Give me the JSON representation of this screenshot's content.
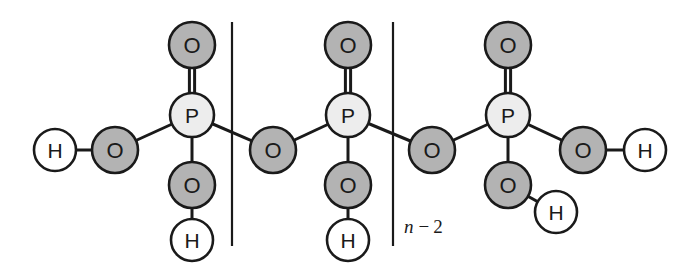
{
  "figure": {
    "background_color": "#ffffff",
    "width": 692,
    "height": 266
  },
  "colors": {
    "oxygen_fill": "#b3b3b3",
    "phosphorus_fill": "#ededed",
    "hydrogen_fill": "#ffffff",
    "outline": "#1a1a1a",
    "bond": "#1a1a1a",
    "text": "#1a1a1a",
    "bracket": "#1a1a1a"
  },
  "atom_labels": {
    "oxygen": "O",
    "phosphorus": "P",
    "hydrogen": "H"
  },
  "repeat_unit": {
    "label_variable": "n",
    "label_operator": "−",
    "label_value": "2",
    "label_full": "n − 2"
  },
  "atoms": [
    {
      "id": "h-left-terminal",
      "element": "H",
      "label": "H",
      "cx": 55,
      "cy": 150,
      "r": 21
    },
    {
      "id": "o-left-hydroxyl",
      "element": "O",
      "label": "O",
      "cx": 115,
      "cy": 150,
      "r": 23
    },
    {
      "id": "p-unit-1",
      "element": "P",
      "label": "P",
      "cx": 192,
      "cy": 115,
      "r": 22
    },
    {
      "id": "o-double-unit-1",
      "element": "O",
      "label": "O",
      "cx": 192,
      "cy": 45,
      "r": 23
    },
    {
      "id": "o-lower-unit-1",
      "element": "O",
      "label": "O",
      "cx": 192,
      "cy": 185,
      "r": 23
    },
    {
      "id": "h-lower-unit-1",
      "element": "H",
      "label": "H",
      "cx": 192,
      "cy": 240,
      "r": 21
    },
    {
      "id": "o-bridge-1",
      "element": "O",
      "label": "O",
      "cx": 273,
      "cy": 150,
      "r": 23
    },
    {
      "id": "p-unit-2",
      "element": "P",
      "label": "P",
      "cx": 348,
      "cy": 115,
      "r": 22
    },
    {
      "id": "o-double-unit-2",
      "element": "O",
      "label": "O",
      "cx": 348,
      "cy": 45,
      "r": 23
    },
    {
      "id": "o-lower-unit-2",
      "element": "O",
      "label": "O",
      "cx": 348,
      "cy": 185,
      "r": 23
    },
    {
      "id": "h-lower-unit-2",
      "element": "H",
      "label": "H",
      "cx": 348,
      "cy": 240,
      "r": 21
    },
    {
      "id": "o-bridge-2",
      "element": "O",
      "label": "O",
      "cx": 432,
      "cy": 150,
      "r": 23
    },
    {
      "id": "p-unit-3",
      "element": "P",
      "label": "P",
      "cx": 508,
      "cy": 115,
      "r": 22
    },
    {
      "id": "o-double-unit-3",
      "element": "O",
      "label": "O",
      "cx": 508,
      "cy": 45,
      "r": 23
    },
    {
      "id": "o-lower-unit-3",
      "element": "O",
      "label": "O",
      "cx": 508,
      "cy": 185,
      "r": 23
    },
    {
      "id": "h-lower-unit-3",
      "element": "H",
      "label": "H",
      "cx": 556,
      "cy": 212,
      "r": 21
    },
    {
      "id": "o-right-hydroxyl",
      "element": "O",
      "label": "O",
      "cx": 583,
      "cy": 150,
      "r": 23
    },
    {
      "id": "h-right-terminal",
      "element": "H",
      "label": "H",
      "cx": 645,
      "cy": 150,
      "r": 21
    }
  ],
  "bonds": [
    {
      "id": "bond-h-o-left",
      "from": "h-left-terminal",
      "to": "o-left-hydroxyl",
      "order": 1
    },
    {
      "id": "bond-o-p-left",
      "from": "o-left-hydroxyl",
      "to": "p-unit-1",
      "order": 1
    },
    {
      "id": "bond-p1-odouble",
      "from": "p-unit-1",
      "to": "o-double-unit-1",
      "order": 2
    },
    {
      "id": "bond-p1-olower",
      "from": "p-unit-1",
      "to": "o-lower-unit-1",
      "order": 1
    },
    {
      "id": "bond-olower1-h",
      "from": "o-lower-unit-1",
      "to": "h-lower-unit-1",
      "order": 1
    },
    {
      "id": "bond-p1-obridge1",
      "from": "p-unit-1",
      "to": "o-bridge-1",
      "order": 1
    },
    {
      "id": "bond-obridge1-p2",
      "from": "o-bridge-1",
      "to": "p-unit-2",
      "order": 1
    },
    {
      "id": "bond-p2-odouble",
      "from": "p-unit-2",
      "to": "o-double-unit-2",
      "order": 2
    },
    {
      "id": "bond-p2-olower",
      "from": "p-unit-2",
      "to": "o-lower-unit-2",
      "order": 1
    },
    {
      "id": "bond-olower2-h",
      "from": "o-lower-unit-2",
      "to": "h-lower-unit-2",
      "order": 1
    },
    {
      "id": "bond-p2-obridge2",
      "from": "p-unit-2",
      "to": "o-bridge-2",
      "order": 1
    },
    {
      "id": "bond-obridge2-p3",
      "from": "o-bridge-2",
      "to": "p-unit-3",
      "order": 1
    },
    {
      "id": "bond-p3-odouble",
      "from": "p-unit-3",
      "to": "o-double-unit-3",
      "order": 2
    },
    {
      "id": "bond-p3-olower",
      "from": "p-unit-3",
      "to": "o-lower-unit-3",
      "order": 1
    },
    {
      "id": "bond-olower3-h",
      "from": "o-lower-unit-3",
      "to": "h-lower-unit-3",
      "order": 1
    },
    {
      "id": "bond-p3-oright",
      "from": "p-unit-3",
      "to": "o-right-hydroxyl",
      "order": 1
    },
    {
      "id": "bond-oright-h",
      "from": "o-right-hydroxyl",
      "to": "h-right-terminal",
      "order": 1
    }
  ],
  "brackets": [
    {
      "id": "bracket-left",
      "x": 232,
      "y_top": 22,
      "y_bottom": 246
    },
    {
      "id": "bracket-right",
      "x": 393,
      "y_top": 22,
      "y_bottom": 246
    }
  ],
  "repeat_label_position": {
    "x": 404,
    "y": 226
  }
}
